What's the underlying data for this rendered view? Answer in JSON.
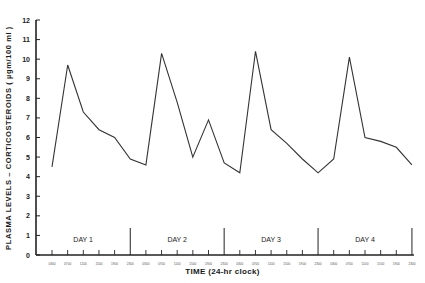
{
  "chart_data": {
    "type": "line",
    "title": "",
    "xlabel": "TIME (24-hr clock)",
    "ylabel": "PLASMA LEVELS – CORTICOSTEROIDS ( µgm/100 ml )",
    "ylim": [
      0,
      12
    ],
    "yticks": [
      0,
      1,
      2,
      3,
      4,
      5,
      6,
      7,
      8,
      9,
      10,
      11,
      12
    ],
    "grid": false,
    "legend": null,
    "day_labels": [
      "DAY 1",
      "DAY 2",
      "DAY 3",
      "DAY 4"
    ],
    "x": [
      "0300",
      "0700",
      "1100",
      "1500",
      "1900",
      "2300",
      "0300",
      "0700",
      "1100",
      "1500",
      "1900",
      "2300",
      "0300",
      "0700",
      "1100",
      "1500",
      "1900",
      "2300",
      "0300",
      "0700",
      "1100",
      "1500",
      "1900",
      "2300"
    ],
    "series": [
      {
        "name": "Plasma corticosteroids",
        "values": [
          4.5,
          9.7,
          7.3,
          6.4,
          6.0,
          4.9,
          4.6,
          10.3,
          7.8,
          5.0,
          6.9,
          4.7,
          4.2,
          10.4,
          6.4,
          5.7,
          4.9,
          4.2,
          4.9,
          10.1,
          6.0,
          5.8,
          5.5,
          4.6
        ]
      }
    ]
  }
}
